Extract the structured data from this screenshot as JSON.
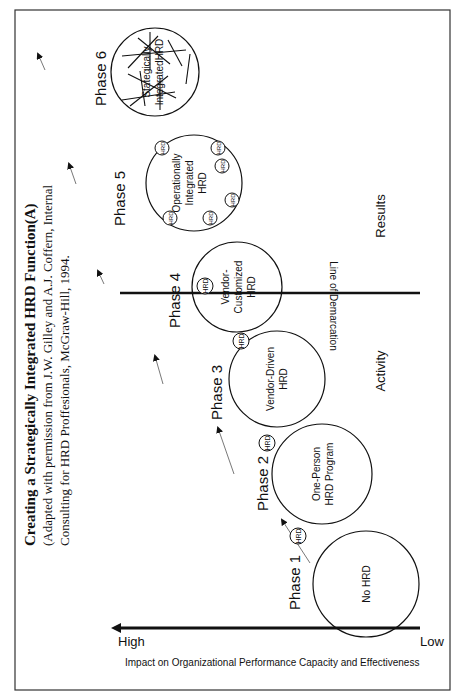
{
  "title": "Creating a Strategically Integrated HRD Function(A)",
  "subtitle_lines": [
    "(Adapted with permission from J.W. Gilley and A.J. Coffern, Internal",
    "Consulting for HRD Proffesionals, McGraw-Hill, 1994."
  ],
  "axis": {
    "label": "Impact on Organizational Performance Capacity and Effectiveness",
    "high": "High",
    "low": "Low"
  },
  "demarcation": {
    "label": "Line of Demarcation",
    "left_region": "Activity",
    "right_region": "Results"
  },
  "hrd_badge": "HRD",
  "phases": [
    {
      "label": "Phase 1",
      "circle_lines": [
        "No HRD"
      ]
    },
    {
      "label": "Phase 2",
      "circle_lines": [
        "One-Person",
        "HRD Program"
      ]
    },
    {
      "label": "Phase 3",
      "circle_lines": [
        "Vendor-Driven",
        "HRD"
      ]
    },
    {
      "label": "Phase 4",
      "circle_lines": [
        "Vendor-",
        "Customized",
        "HRD"
      ]
    },
    {
      "label": "Phase 5",
      "circle_lines": [
        "Operationally",
        "Integrated",
        "HRD"
      ]
    },
    {
      "label": "Phase 6",
      "circle_lines": [
        "Stategically",
        "IntegratedHRD"
      ]
    }
  ]
}
